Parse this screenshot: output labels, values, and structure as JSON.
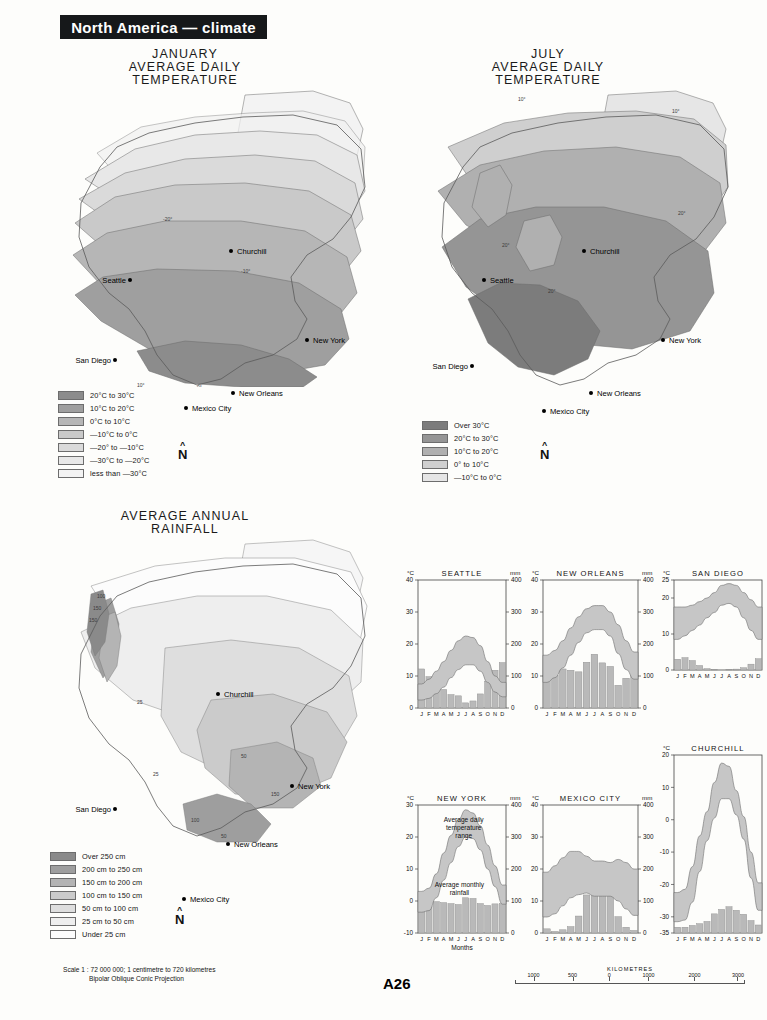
{
  "header": {
    "title": "North America  —  climate"
  },
  "maps": [
    {
      "id": "january",
      "title": "JANUARY\nAVERAGE DAILY\nTEMPERATURE",
      "cities": [
        {
          "name": "Churchill",
          "x": 228,
          "y": 212,
          "anchor": "start"
        },
        {
          "name": "Seattle",
          "x": 128,
          "y": 241,
          "anchor": "end"
        },
        {
          "name": "New York",
          "x": 307,
          "y": 301,
          "anchor": "start"
        },
        {
          "name": "San Diego",
          "x": 113,
          "y": 321,
          "anchor": "end"
        },
        {
          "name": "New Orleans",
          "x": 233,
          "y": 354,
          "anchor": "start"
        },
        {
          "name": "Mexico City",
          "x": 186,
          "y": 408,
          "anchor": "start"
        }
      ],
      "isolines": [
        "-20°",
        "-10°",
        "0°",
        "10°",
        "20°",
        "0°",
        "10°"
      ],
      "legend": [
        {
          "label": "20°C to 30°C",
          "color": "#8c8c8c"
        },
        {
          "label": "10°C to 20°C",
          "color": "#9f9f9f"
        },
        {
          "label": "0°C to 10°C",
          "color": "#b6b6b6"
        },
        {
          "label": "—10°C to 0°C",
          "color": "#c9c9c9"
        },
        {
          "label": "—20° to —10°C",
          "color": "#dadada"
        },
        {
          "label": "—30°C to —20°C",
          "color": "#e8e8e8"
        },
        {
          "label": "less than —30°C",
          "color": "#f3f3f3"
        }
      ],
      "north_label": "N"
    },
    {
      "id": "july",
      "title": "JULY\nAVERAGE DAILY\nTEMPERATURE",
      "cities": [
        {
          "name": "Churchill",
          "x": 590,
          "y": 212,
          "anchor": "start"
        },
        {
          "name": "Seattle",
          "x": 492,
          "y": 241,
          "anchor": "start"
        },
        {
          "name": "New York",
          "x": 668,
          "y": 301,
          "anchor": "start"
        },
        {
          "name": "San Diego",
          "x": 475,
          "y": 327,
          "anchor": "end"
        },
        {
          "name": "New Orleans",
          "x": 595,
          "y": 354,
          "anchor": "start"
        },
        {
          "name": "Mexico City",
          "x": 550,
          "y": 411,
          "anchor": "start"
        }
      ],
      "isolines": [
        "10°",
        "10°",
        "20°",
        "20°",
        "20°",
        "20°"
      ],
      "legend": [
        {
          "label": "Over 30°C",
          "color": "#7c7c7c"
        },
        {
          "label": "20°C to 30°C",
          "color": "#959595"
        },
        {
          "label": "10°C to 20°C",
          "color": "#b0b0b0"
        },
        {
          "label": "0° to 10°C",
          "color": "#cfcfcf"
        },
        {
          "label": "—10°C to 0°C",
          "color": "#e6e6e6"
        }
      ],
      "north_label": "N"
    },
    {
      "id": "rainfall",
      "title": "AVERAGE ANNUAL\nRAINFALL",
      "cities": [
        {
          "name": "Churchill",
          "x": 222,
          "y": 670,
          "anchor": "start"
        },
        {
          "name": "New York",
          "x": 292,
          "y": 762,
          "anchor": "start"
        },
        {
          "name": "San Diego",
          "x": 113,
          "y": 785,
          "anchor": "end"
        },
        {
          "name": "New Orleans",
          "x": 228,
          "y": 820,
          "anchor": "start"
        },
        {
          "name": "Mexico City",
          "x": 185,
          "y": 875,
          "anchor": "start"
        }
      ],
      "isolines": [
        "100",
        "150",
        "150",
        "100",
        "50",
        "25",
        "150",
        "100",
        "50"
      ],
      "legend": [
        {
          "label": "Over 250 cm",
          "color": "#8a8a8a"
        },
        {
          "label": "200 cm to 250 cm",
          "color": "#9e9e9e"
        },
        {
          "label": "150 cm to 200 cm",
          "color": "#b4b4b4"
        },
        {
          "label": "100 cm to 150 cm",
          "color": "#cbcbcb"
        },
        {
          "label": "50 cm to 100 cm",
          "color": "#dedede"
        },
        {
          "label": "25 cm to 50 cm",
          "color": "#eeeeee"
        },
        {
          "label": "Under 25 cm",
          "color": "#fcfcfc"
        }
      ],
      "north_label": "N"
    }
  ],
  "footer": {
    "scale_line1": "Scale 1 : 72 000 000; 1 centimetre to 720 kilometres",
    "scale_line2": "Bipolar Oblique Conic Projection",
    "page_number": "A26",
    "km_scale": {
      "title": "KILOMETRES",
      "ticks": [
        "1000",
        "500",
        "0",
        "1000",
        "2000",
        "3000"
      ]
    }
  },
  "graph_common": {
    "months": [
      "J",
      "F",
      "M",
      "A",
      "M",
      "J",
      "J",
      "A",
      "S",
      "O",
      "N",
      "D"
    ],
    "unit_temp": "°C",
    "unit_rain": "mm",
    "annotation_temp": "Average daily\ntemperature\nrange",
    "annotation_rain": "Average monthly\nrainfall",
    "axis_label_months": "Months",
    "band_color": "#c6c6c6",
    "bar_color": "#b9b9b9"
  },
  "chart_data": [
    {
      "type": "area",
      "id": "seattle",
      "title": "SEATTLE",
      "xlabel": "",
      "ylabel": "°C",
      "y2label": "mm",
      "categories": [
        "J",
        "F",
        "M",
        "A",
        "M",
        "J",
        "J",
        "A",
        "S",
        "O",
        "N",
        "D"
      ],
      "ylim": [
        0,
        40
      ],
      "yticks": [
        0,
        10,
        20,
        30,
        40
      ],
      "y2lim": [
        0,
        400
      ],
      "y2ticks": [
        0,
        100,
        200,
        300,
        400
      ],
      "grid": false,
      "legend": "none",
      "series": [
        {
          "name": "Average daily maximum temperature (°C)",
          "values": [
            7.5,
            9.0,
            11.5,
            14.5,
            18.0,
            21.0,
            22.5,
            22.0,
            19.5,
            14.5,
            10.0,
            8.0
          ]
        },
        {
          "name": "Average daily minimum temperature (°C)",
          "values": [
            2.5,
            3.0,
            4.5,
            6.5,
            9.5,
            12.0,
            13.5,
            13.5,
            11.5,
            8.0,
            5.0,
            3.5
          ]
        },
        {
          "name": "Average monthly rainfall (mm)",
          "values": [
            122,
            98,
            85,
            58,
            42,
            38,
            16,
            22,
            44,
            84,
            118,
            142
          ]
        }
      ]
    },
    {
      "type": "area",
      "id": "new-orleans",
      "title": "NEW ORLEANS",
      "xlabel": "",
      "ylabel": "°C",
      "y2label": "mm",
      "categories": [
        "J",
        "F",
        "M",
        "A",
        "M",
        "J",
        "J",
        "A",
        "S",
        "O",
        "N",
        "D"
      ],
      "ylim": [
        0,
        40
      ],
      "yticks": [
        0,
        10,
        20,
        30,
        40
      ],
      "y2lim": [
        0,
        400
      ],
      "y2ticks": [
        0,
        100,
        200,
        300,
        400
      ],
      "grid": false,
      "legend": "none",
      "series": [
        {
          "name": "Average daily maximum temperature (°C)",
          "values": [
            16.5,
            18.0,
            21.0,
            25.0,
            28.5,
            31.0,
            32.0,
            32.0,
            30.0,
            26.0,
            21.0,
            17.5
          ]
        },
        {
          "name": "Average daily minimum temperature (°C)",
          "values": [
            8.0,
            9.5,
            12.5,
            16.5,
            20.5,
            23.5,
            24.5,
            24.5,
            22.5,
            17.0,
            12.0,
            9.0
          ]
        },
        {
          "name": "Average monthly rainfall (mm)",
          "values": [
            118,
            101,
            122,
            118,
            113,
            143,
            168,
            141,
            130,
            71,
            93,
            115
          ]
        }
      ]
    },
    {
      "type": "area",
      "id": "san-diego",
      "title": "SAN DIEGO",
      "xlabel": "",
      "ylabel": "°C",
      "y2label": "mm",
      "categories": [
        "J",
        "F",
        "M",
        "A",
        "M",
        "J",
        "J",
        "A",
        "S",
        "O",
        "N",
        "D"
      ],
      "ylim": [
        0,
        25
      ],
      "yticks": [
        0,
        10,
        20,
        25
      ],
      "y2lim": [
        0,
        400
      ],
      "y2ticks": [
        0,
        100,
        200,
        300,
        400
      ],
      "grid": false,
      "legend": "none",
      "series": [
        {
          "name": "Average daily maximum temperature (°C)",
          "values": [
            17.5,
            17.5,
            18.0,
            19.0,
            20.0,
            21.5,
            23.5,
            24.0,
            23.5,
            21.5,
            19.5,
            17.5
          ]
        },
        {
          "name": "Average daily minimum temperature (°C)",
          "values": [
            8.5,
            9.5,
            11.0,
            12.5,
            14.5,
            16.0,
            18.0,
            18.5,
            17.5,
            14.5,
            11.0,
            8.5
          ]
        },
        {
          "name": "Average monthly rainfall (mm)",
          "values": [
            48,
            55,
            42,
            20,
            6,
            2,
            0,
            1,
            4,
            10,
            26,
            50
          ]
        }
      ]
    },
    {
      "type": "area",
      "id": "new-york",
      "title": "NEW YORK",
      "xlabel": "Months",
      "ylabel": "°C",
      "y2label": "mm",
      "categories": [
        "J",
        "F",
        "M",
        "A",
        "M",
        "J",
        "J",
        "A",
        "S",
        "O",
        "N",
        "D"
      ],
      "ylim": [
        -10,
        30
      ],
      "yticks": [
        -10,
        0,
        10,
        20,
        30
      ],
      "y2lim": [
        0,
        400
      ],
      "y2ticks": [
        0,
        100,
        200,
        300,
        400
      ],
      "grid": false,
      "legend": "none",
      "annotations": [
        "Average daily temperature range",
        "Average monthly rainfall"
      ],
      "series": [
        {
          "name": "Average daily maximum temperature (°C)",
          "values": [
            3.0,
            4.0,
            8.5,
            15.0,
            20.5,
            25.5,
            28.5,
            27.5,
            23.5,
            17.5,
            11.0,
            5.0
          ]
        },
        {
          "name": "Average daily minimum temperature (°C)",
          "values": [
            -3.5,
            -3.0,
            1.0,
            6.5,
            12.0,
            17.0,
            20.0,
            19.5,
            16.0,
            10.0,
            4.5,
            -1.0
          ]
        },
        {
          "name": "Average monthly rainfall (mm)",
          "values": [
            84,
            84,
            98,
            95,
            92,
            89,
            110,
            108,
            92,
            86,
            91,
            92
          ]
        }
      ]
    },
    {
      "type": "area",
      "id": "mexico-city",
      "title": "MEXICO CITY",
      "xlabel": "",
      "ylabel": "°C",
      "y2label": "mm",
      "categories": [
        "J",
        "F",
        "M",
        "A",
        "M",
        "J",
        "J",
        "A",
        "S",
        "O",
        "N",
        "D"
      ],
      "ylim": [
        0,
        40
      ],
      "yticks": [
        0,
        10,
        20,
        30,
        40
      ],
      "y2lim": [
        0,
        400
      ],
      "y2ticks": [
        0,
        100,
        200,
        300,
        400
      ],
      "grid": false,
      "legend": "none",
      "series": [
        {
          "name": "Average daily maximum temperature (°C)",
          "values": [
            19.0,
            21.0,
            23.5,
            25.5,
            25.5,
            24.0,
            22.5,
            22.5,
            22.0,
            23.0,
            22.0,
            20.0
          ]
        },
        {
          "name": "Average daily minimum temperature (°C)",
          "values": [
            5.0,
            6.0,
            8.5,
            11.0,
            12.0,
            12.5,
            11.5,
            11.5,
            11.5,
            10.0,
            7.5,
            5.5
          ]
        },
        {
          "name": "Average monthly rainfall (mm)",
          "values": [
            13,
            5,
            10,
            20,
            53,
            119,
            170,
            152,
            130,
            51,
            18,
            8
          ]
        }
      ]
    },
    {
      "type": "area",
      "id": "churchill",
      "title": "CHURCHILL",
      "xlabel": "",
      "ylabel": "°C",
      "y2label": "mm",
      "categories": [
        "J",
        "F",
        "M",
        "A",
        "M",
        "J",
        "J",
        "A",
        "S",
        "O",
        "N",
        "D"
      ],
      "ylim": [
        -35,
        20
      ],
      "yticks": [
        -35,
        -30,
        -20,
        -10,
        0,
        10,
        20
      ],
      "y2lim": [
        0,
        400
      ],
      "y2ticks": [
        0,
        100,
        200,
        300,
        400
      ],
      "grid": false,
      "legend": "none",
      "series": [
        {
          "name": "Average daily maximum temperature (°C)",
          "values": [
            -22.5,
            -21.5,
            -14.5,
            -5.0,
            2.5,
            11.5,
            17.5,
            16.5,
            9.0,
            1.0,
            -10.0,
            -19.5
          ]
        },
        {
          "name": "Average daily minimum temperature (°C)",
          "values": [
            -31.5,
            -31.0,
            -25.5,
            -16.0,
            -6.5,
            0.5,
            6.5,
            6.5,
            1.5,
            -6.0,
            -18.0,
            -28.0
          ]
        },
        {
          "name": "Average monthly rainfall (mm)",
          "values": [
            13,
            13,
            17,
            21,
            26,
            43,
            53,
            59,
            51,
            42,
            28,
            18
          ]
        }
      ]
    }
  ]
}
